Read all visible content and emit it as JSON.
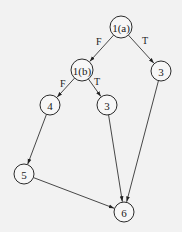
{
  "diagram": {
    "type": "control-flow-graph",
    "nodes": [
      {
        "id": "n1a",
        "label": "1(a)",
        "x": 121,
        "y": 27,
        "r": 11
      },
      {
        "id": "n1b",
        "label": "1(b)",
        "x": 82,
        "y": 70,
        "r": 11
      },
      {
        "id": "n3r",
        "label": "3",
        "x": 161,
        "y": 71,
        "r": 10
      },
      {
        "id": "n4",
        "label": "4",
        "x": 50,
        "y": 105,
        "r": 10
      },
      {
        "id": "n3m",
        "label": "3",
        "x": 107,
        "y": 105,
        "r": 10
      },
      {
        "id": "n5",
        "label": "5",
        "x": 24,
        "y": 174,
        "r": 10
      },
      {
        "id": "n6",
        "label": "6",
        "x": 124,
        "y": 212,
        "r": 10
      }
    ],
    "edges": [
      {
        "from": "n1a",
        "to": "n1b",
        "label": "F",
        "lx": 96,
        "ly": 45
      },
      {
        "from": "n1a",
        "to": "n3r",
        "label": "T",
        "lx": 142,
        "ly": 44
      },
      {
        "from": "n1b",
        "to": "n4",
        "label": "F",
        "lx": 60,
        "ly": 87
      },
      {
        "from": "n1b",
        "to": "n3m",
        "label": "T",
        "lx": 94,
        "ly": 85
      },
      {
        "from": "n4",
        "to": "n5",
        "label": ""
      },
      {
        "from": "n3m",
        "to": "n6",
        "label": ""
      },
      {
        "from": "n3r",
        "to": "n6",
        "label": ""
      },
      {
        "from": "n5",
        "to": "n6",
        "label": ""
      }
    ]
  }
}
